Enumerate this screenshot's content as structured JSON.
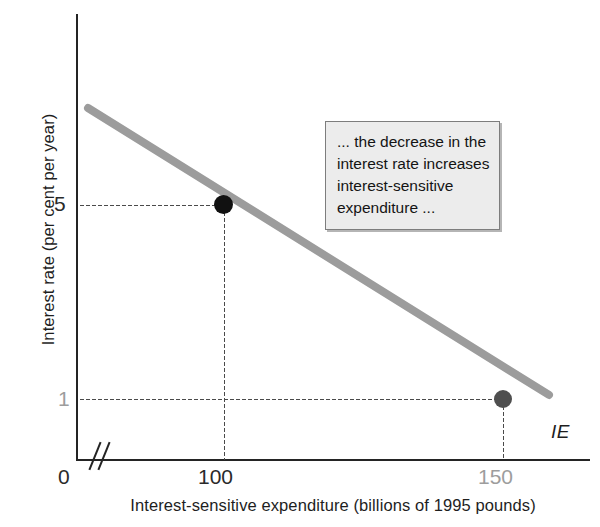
{
  "chart_data": {
    "type": "line",
    "title": "",
    "xlabel": "Interest-sensitive expenditure (billions of 1995 pounds)",
    "ylabel": "Interest rate (per cent per year)",
    "xlim": [
      0,
      170
    ],
    "ylim": [
      0,
      9
    ],
    "grid": false,
    "legend": "none",
    "x_ticks": [
      "0",
      "100",
      "150"
    ],
    "y_ticks": [
      "5",
      "1"
    ],
    "series": [
      {
        "name": "IE",
        "label": "IE",
        "color": "#9c9c9c",
        "x": [
          88,
          160
        ],
        "y": [
          7.4,
          0.2
        ],
        "points": [
          {
            "x": 100,
            "y": 5,
            "label": "100",
            "color": "#111111"
          },
          {
            "x": 150,
            "y": 1,
            "label": "150",
            "color": "#4f4f4f"
          }
        ]
      }
    ],
    "annotations": [
      {
        "name": "decrease-callout",
        "text": "... the decrease in the interest rate increases interest-sensitive expenditure ..."
      }
    ],
    "axis_break": true
  },
  "axes": {
    "y_title": "Interest rate (per cent per year)",
    "x_title": "Interest-sensitive expenditure (billions of 1995 pounds)",
    "ticks": {
      "y_5": "5",
      "y_1": "1",
      "x_0": "0",
      "x_100": "100",
      "x_150": "150"
    }
  },
  "curve": {
    "label": "IE"
  },
  "callout": {
    "text": "... the decrease in the interest rate increases interest-sensitive expenditure ..."
  }
}
